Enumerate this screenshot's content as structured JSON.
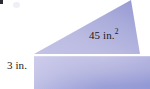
{
  "figure": {
    "labels": {
      "area": "45 in.",
      "area_exponent": "2",
      "height": "3 in."
    },
    "colors": {
      "triangle_light": "#cfcdec",
      "triangle_mid": "#b9b9e0",
      "triangle_dark": "#9a9dd6",
      "rectangle_light": "#c8c6e8",
      "rectangle_dark": "#8f96d4",
      "divider": "#ffffff",
      "background": "#ffffff",
      "text": "#1a1a1a",
      "corner_mark": "#2b2b33"
    },
    "geometry": {
      "triangle_points": "34,54 131,0 139,54",
      "rectangle": {
        "x": 34,
        "y": 56,
        "width": 116,
        "height": 33
      },
      "divider_y": 54.5,
      "divider_height": 2
    }
  }
}
